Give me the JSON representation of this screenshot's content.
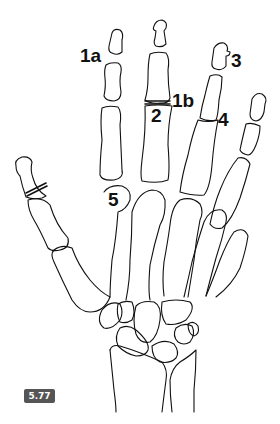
{
  "figure": {
    "number": "5.77",
    "labels": {
      "l1a": "1a",
      "l1b": "1b",
      "l2": "2",
      "l3": "3",
      "l4": "4",
      "l5": "5"
    },
    "colors": {
      "line": "#111111",
      "badge_bg": "#555555",
      "badge_text": "#ffffff"
    }
  }
}
